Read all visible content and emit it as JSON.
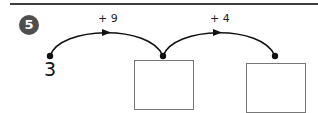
{
  "exercise": {
    "number": "5",
    "start_value": "3",
    "jumps": [
      {
        "label": "+ 9"
      },
      {
        "label": "+ 4"
      }
    ],
    "answer_boxes": [
      {
        "value": ""
      },
      {
        "value": ""
      }
    ]
  },
  "colors": {
    "badge_bg": "#4f4f4f",
    "line": "#111111",
    "box_border": "#777777",
    "rule": "#3f3f3f"
  }
}
